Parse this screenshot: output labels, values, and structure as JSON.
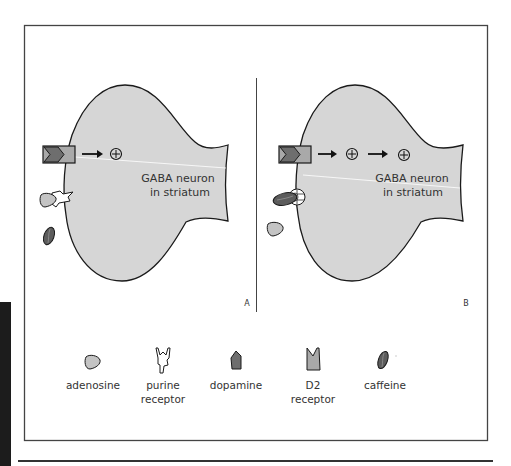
{
  "figure": {
    "panels": [
      {
        "id": "A",
        "letter": "A",
        "neuron_label_line1": "GABA neuron",
        "neuron_label_line2": "in striatum",
        "plus_symbols": 1,
        "caffeine_bound": false
      },
      {
        "id": "B",
        "letter": "B",
        "neuron_label_line1": "GABA neuron",
        "neuron_label_line2": "in striatum",
        "plus_symbols": 2,
        "caffeine_bound": true
      }
    ],
    "legend": [
      {
        "id": "adenosine",
        "line1": "adenosine",
        "line2": ""
      },
      {
        "id": "purine-receptor",
        "line1": "purine",
        "line2": "receptor"
      },
      {
        "id": "dopamine",
        "line1": "dopamine",
        "line2": ""
      },
      {
        "id": "d2-receptor",
        "line1": "D2",
        "line2": "receptor"
      },
      {
        "id": "caffeine",
        "line1": "caffeine",
        "line2": ""
      }
    ],
    "colors": {
      "neuron_fill": "#d6d6d6",
      "outline": "#1a1a1a",
      "dopamine_fill": "#6e6e6e",
      "receptor_fill": "#a9a9a9",
      "adenosine_fill": "#c4c4c4",
      "caffeine_fill": "#5c5c5c",
      "frame": "#444444",
      "sidebar": "#1c1c1c"
    }
  }
}
